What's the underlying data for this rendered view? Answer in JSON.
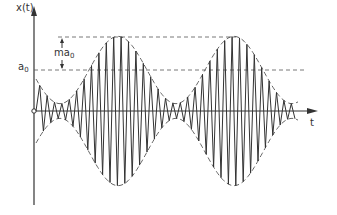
{
  "diagram": {
    "y_axis_label": "x(t)",
    "x_axis_label": "t",
    "carrier_amplitude_label": "a",
    "carrier_amplitude_sub": "0",
    "modulation_label": "ma",
    "modulation_sub": "0",
    "colors": {
      "line": "#333333",
      "dashed": "#555555",
      "background": "#ffffff"
    }
  }
}
